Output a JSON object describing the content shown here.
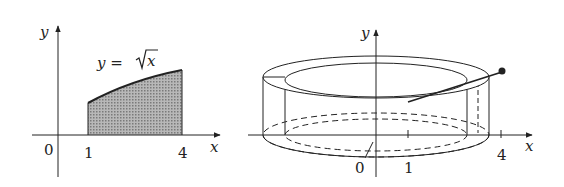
{
  "left_figure": {
    "y_axis_label": "y",
    "x_axis_label": "x",
    "origin_label": "0",
    "tick_labels": [
      "1",
      "4"
    ],
    "curve_label_prefix": "y = ",
    "curve_label_radicand": "x",
    "shaded_region": "area under y = √x from x = 1 to x = 4"
  },
  "right_figure": {
    "y_axis_label": "y",
    "x_axis_label": "x",
    "origin_label": "0",
    "tick_labels": [
      "1",
      "4"
    ],
    "description": "solid of revolution (washer/cylindrical shell) formed by rotating region about y-axis"
  },
  "colors": {
    "ink": "#222222",
    "shade": "#9a9a9a"
  }
}
